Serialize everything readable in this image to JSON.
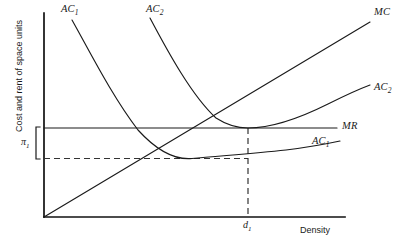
{
  "chart_data": {
    "type": "line",
    "title": "",
    "xlabel": "Density",
    "ylabel": "Cost and rent of space units",
    "grid": false,
    "legend": "inline-curve-labels",
    "axis": {
      "x_origin_label": "",
      "y_origin_label": "",
      "xlim_note": "Density increasing rightward, no numeric ticks",
      "ylim_note": "Cost and rent increasing upward, no numeric ticks"
    },
    "annotations": [
      {
        "name": "pi-1",
        "text": "π",
        "sub": "1",
        "meaning": "profit per unit bracket between MR level and AC1 minimum"
      },
      {
        "name": "d-1",
        "text": "d",
        "sub": "1",
        "meaning": "equilibrium density on x-axis"
      }
    ],
    "series": [
      {
        "name": "AC_1",
        "label": "AC",
        "sub": "1",
        "label_positions": [
          {
            "x": 61,
            "y": 9
          },
          {
            "x": 312,
            "y": 137
          }
        ],
        "description": "U-shaped average cost curve, minimum at low density",
        "path": "M 72,20 C 90,52 112,96 138,130 C 158,152 176,160 192,158.5 C 216,156 250,154 286,150 C 310,147 326,144 340,141"
      },
      {
        "name": "AC_2",
        "label": "AC",
        "sub": "2",
        "label_positions": [
          {
            "x": 148,
            "y": 9
          },
          {
            "x": 374,
            "y": 85
          }
        ],
        "description": "U-shaped average cost curve shifted right, minimum tangent to MR at d1",
        "path": "M 150,18 C 168,52 192,96 216,118 C 230,127 240,128 248,128 C 272,128 300,118 328,104 C 348,94 362,88 370,85"
      },
      {
        "name": "MC",
        "label": "MC",
        "sub": "",
        "label_positions": [
          {
            "x": 374,
            "y": 9
          }
        ],
        "description": "Upward sloping marginal cost ray from origin through AC1 min and AC2 min",
        "path": "M 44,217 L 370,22"
      },
      {
        "name": "MR",
        "label": "MR",
        "sub": "",
        "label_positions": [
          {
            "x": 342,
            "y": 122
          }
        ],
        "description": "Horizontal marginal revenue line tangent to AC2 minimum",
        "path": "M 44,128 L 337,128"
      }
    ],
    "guides": [
      {
        "name": "pi-level-dashed",
        "orientation": "horizontal",
        "path": "M 44,158.5 L 248,158.5"
      },
      {
        "name": "d1-dashed",
        "orientation": "vertical",
        "path": "M 248,128 L 248,217"
      }
    ],
    "axes_lines": {
      "y_axis": "M 44,13 L 44,217",
      "x_axis": "M 44,217 L 345,217"
    },
    "bracket": {
      "name": "pi-bracket",
      "path": "M 40,127 L 36,127 L 36,159 L 40,159"
    },
    "colors": {
      "line": "#1a1a1a",
      "axis": "#111111",
      "background": "#ffffff",
      "dash": "#333333"
    }
  },
  "labels": {
    "ac1": "AC",
    "ac1_sub": "1",
    "ac1_right": "AC",
    "ac1_right_sub": "1",
    "ac2": "AC",
    "ac2_sub": "2",
    "ac2_right": "AC",
    "ac2_right_sub": "2",
    "mc": "MC",
    "mr": "MR",
    "pi": "π",
    "pi_sub": "1",
    "d": "d",
    "d_sub": "1",
    "xaxis": "Density",
    "yaxis": "Cost and rent of space units"
  }
}
